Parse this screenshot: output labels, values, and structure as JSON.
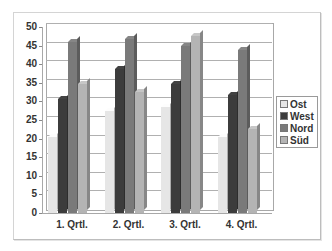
{
  "chart_data": {
    "type": "bar",
    "subtype": "3d-clustered-column",
    "title": "",
    "xlabel": "",
    "ylabel": "",
    "categories": [
      "1. Qrtl.",
      "2. Qrtl.",
      "3. Qrtl.",
      "4. Qrtl."
    ],
    "series": [
      {
        "name": "Ost",
        "color": "#e6e6e6",
        "values": [
          20.4,
          27.4,
          28.6,
          20.4
        ]
      },
      {
        "name": "West",
        "color": "#3c3c3c",
        "values": [
          30.6,
          38.6,
          34.6,
          31.6
        ]
      },
      {
        "name": "Nord",
        "color": "#7a7a7a",
        "values": [
          45.9,
          46.9,
          45.0,
          43.9
        ]
      },
      {
        "name": "Süd",
        "color": "#b4b4b4",
        "values": [
          34.6,
          32.6,
          47.5,
          22.6
        ]
      }
    ],
    "ylim": [
      0,
      50
    ],
    "yticks": [
      0,
      5,
      10,
      15,
      20,
      25,
      30,
      35,
      40,
      45,
      50
    ],
    "grid": true,
    "legend_position": "right"
  },
  "legend": {
    "items": [
      {
        "label": "Ost"
      },
      {
        "label": "West"
      },
      {
        "label": "Nord"
      },
      {
        "label": "Süd"
      }
    ]
  }
}
